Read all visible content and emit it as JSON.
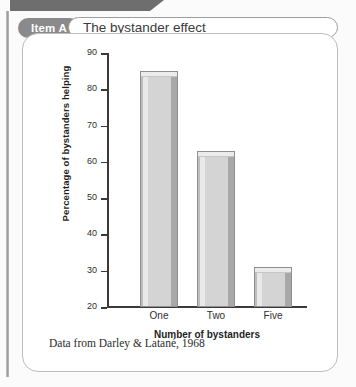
{
  "card": {
    "item_badge": "Item A",
    "title": "The bystander effect",
    "caption": "Data from Darley & Latané, 1968"
  },
  "colors": {
    "badge_bg": "#8a8a8a",
    "top_tab": "#6e6e6e",
    "bar_fill": "#d4d4d4",
    "bar_edge": "#8f8f8f",
    "axis": "#3a3a3a",
    "card_border": "#bdbdbd"
  },
  "chart_data": {
    "type": "bar",
    "title": "The bystander effect",
    "categories": [
      "One",
      "Two",
      "Five"
    ],
    "values": [
      85,
      63,
      31
    ],
    "xlabel": "Number of bystanders",
    "ylabel": "Percentage of bystanders helping",
    "ylim": [
      20,
      90
    ],
    "yticks": [
      20,
      30,
      40,
      50,
      60,
      70,
      80,
      90
    ],
    "ytick_labels": [
      "20",
      "30",
      "40",
      "50",
      "60",
      "70",
      "80",
      "90"
    ],
    "grid": false,
    "legend": null,
    "source_note": "Data from Darley & Latané, 1968"
  }
}
